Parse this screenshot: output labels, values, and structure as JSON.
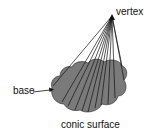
{
  "diagram": {
    "labels": {
      "vertex": "vertex",
      "base": "base",
      "surface": "conic surface"
    },
    "colors": {
      "fill": "#7a7a7a",
      "stroke": "#111111",
      "background": "#ffffff"
    }
  }
}
